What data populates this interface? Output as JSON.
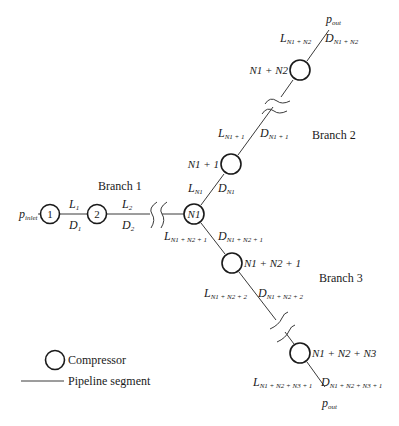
{
  "diagram": {
    "inlet_label": "p",
    "inlet_sub": "inlet",
    "outlet_label": "p",
    "outlet_sub": "out",
    "branches": [
      {
        "label": "Branch 1"
      },
      {
        "label": "Branch 2"
      },
      {
        "label": "Branch 3"
      }
    ],
    "compressors": {
      "c1": "1",
      "c2": "2",
      "cN1": "N1",
      "cN1p1": "N1 + 1",
      "cN1pN2": "N1 + N2",
      "cN1pN2p1": "N1 + N2 + 1",
      "cN1pN2pN3": "N1 + N2 + N3"
    },
    "segments": {
      "s1": {
        "L": "L",
        "L_sub": "1",
        "D": "D",
        "D_sub": "1"
      },
      "s2": {
        "L": "L",
        "L_sub": "2",
        "D": "D",
        "D_sub": "2"
      },
      "sN1": {
        "L": "L",
        "L_sub": "N1",
        "D": "D",
        "D_sub": "N1"
      },
      "sN1p1": {
        "L": "L",
        "L_sub": "N1 + 1",
        "D": "D",
        "D_sub": "N1 + 1"
      },
      "sN1pN2": {
        "L": "L",
        "L_sub": "N1 + N2",
        "D": "D",
        "D_sub": "N1 + N2"
      },
      "sN1pN2p1": {
        "L": "L",
        "L_sub": "N1 + N2 + 1",
        "D": "D",
        "D_sub": "N1 + N2 + 1"
      },
      "sN1pN2p2": {
        "L": "L",
        "L_sub": "N1 + N2 + 2",
        "D": "D",
        "D_sub": "N1 + N2 + 2"
      },
      "sN1pN2pN3p1": {
        "L": "L",
        "L_sub": "N1 + N2 + N3 + 1",
        "D": "D",
        "D_sub": "N1 + N2 + N3 + 1"
      }
    },
    "legend": {
      "compressor": "Compressor",
      "pipeline": "Pipeline segment"
    }
  }
}
